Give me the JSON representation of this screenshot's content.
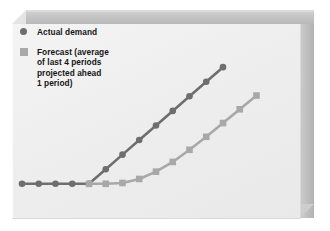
{
  "figure": {
    "background_color": "#ffffff",
    "panel_color": "#efefef",
    "frame_color": "#c3c3c3"
  },
  "legend": {
    "position": "top-left",
    "entries": [
      {
        "marker": "circle",
        "marker_icon": "legend-circle-marker",
        "color": "#6e6e6e",
        "label": "Actual demand"
      },
      {
        "marker": "square",
        "marker_icon": "legend-square-marker",
        "color": "#a8a8a8",
        "label": "Forecast (average\nof last 4 periods\nprojected ahead\n1 period)"
      }
    ]
  },
  "chart_data": {
    "type": "line",
    "title": "",
    "subtitle": "",
    "xlabel": "",
    "ylabel": "",
    "xlim": [
      0,
      16
    ],
    "ylim": [
      0,
      10
    ],
    "grid": false,
    "axes_visible": false,
    "tick_labels_x": [],
    "tick_labels_y": [],
    "legend_position": "top-left",
    "x": [
      0,
      1,
      2,
      3,
      4,
      5,
      6,
      7,
      8,
      9,
      10,
      11,
      12,
      13,
      14,
      15
    ],
    "series": [
      {
        "name": "Actual demand",
        "color": "#6e6e6e",
        "marker": "circle",
        "linewidth": 2.6,
        "values": [
          1.0,
          1.0,
          1.0,
          1.0,
          1.0,
          1.9,
          2.8,
          3.7,
          4.6,
          5.5,
          6.4,
          7.3,
          8.2,
          null,
          null,
          null
        ],
        "note": "flat baseline then steady linear rise"
      },
      {
        "name": "Forecast (average of last 4 periods projected ahead 1 period)",
        "color": "#a8a8a8",
        "marker": "square",
        "linewidth": 2.6,
        "values": [
          null,
          null,
          null,
          null,
          1.0,
          1.0,
          1.05,
          1.3,
          1.75,
          2.35,
          3.1,
          3.9,
          4.75,
          5.6,
          6.45,
          null
        ],
        "note": "lags actual demand; gradual curved ramp-up from moving average"
      }
    ],
    "annotations": [
      "Forecast trails actual demand because the 4-period moving average responds slowly to the trend."
    ]
  }
}
